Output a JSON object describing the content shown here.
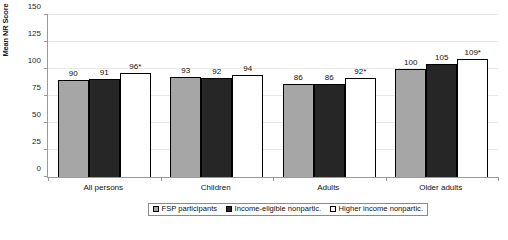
{
  "chart_data": {
    "type": "bar",
    "title": "",
    "xlabel": "",
    "ylabel": "Mean NR Score",
    "ylim": [
      0,
      150
    ],
    "yticks": [
      0,
      25,
      50,
      75,
      100,
      125,
      150
    ],
    "grid": true,
    "legend_position": "bottom-center",
    "categories": [
      "All persons",
      "Children",
      "Adults",
      "Older adults"
    ],
    "series": [
      {
        "name": "FSP participants",
        "color": "#a6a6a6",
        "values": [
          90,
          93,
          86,
          100
        ],
        "labels": [
          "90",
          "93",
          "86",
          "100"
        ]
      },
      {
        "name": "Income-eligible nonpartic.",
        "color": "#262626",
        "values": [
          91,
          92,
          86,
          105
        ],
        "labels": [
          "91",
          "92",
          "86",
          "105"
        ]
      },
      {
        "name": "Higher income nonpartic.",
        "color": "#ffffff",
        "values": [
          96,
          94,
          92,
          109
        ],
        "labels": [
          "96*",
          "94",
          "92*",
          "109*"
        ]
      }
    ]
  },
  "caption": ""
}
